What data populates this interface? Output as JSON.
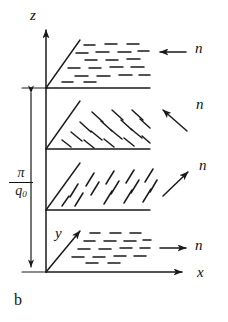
{
  "figure": {
    "panel_label": "b",
    "caption_letter": "b",
    "background_color": "#ffffff",
    "ink_color": "#1a1a1a"
  },
  "axes": {
    "z": {
      "label": "z",
      "x": 31,
      "y": 12
    },
    "x": {
      "label": "x",
      "x": 198,
      "y": 274
    },
    "y": {
      "label": "y",
      "x": 55,
      "y": 228
    }
  },
  "pitch_annotation": {
    "numerator": "π",
    "denominator": "q",
    "denominator_subscript": "0",
    "combined": "π/q₀",
    "arrow_style": "double-headed-vertical",
    "top_y": 88,
    "bottom_y": 272
  },
  "layers": [
    {
      "index": 1,
      "position": "top",
      "base_y": 88,
      "director_label": "n",
      "director_arrow_direction": "left",
      "director_arrow_angle_deg": 180,
      "dash_orientation": "horizontal",
      "dash_angle_deg": 0
    },
    {
      "index": 2,
      "position": "upper-middle",
      "base_y": 149,
      "director_label": "n",
      "director_arrow_direction": "up-left",
      "director_arrow_angle_deg": 145,
      "dash_orientation": "tilted-down-right",
      "dash_angle_deg": -40
    },
    {
      "index": 3,
      "position": "lower-middle",
      "base_y": 210,
      "director_label": "n",
      "director_arrow_direction": "up-right",
      "director_arrow_angle_deg": 38,
      "dash_orientation": "tilted-up-right",
      "dash_angle_deg": 55
    },
    {
      "index": 4,
      "position": "bottom",
      "base_y": 272,
      "director_label": "n",
      "director_arrow_direction": "right",
      "director_arrow_angle_deg": 0,
      "dash_orientation": "horizontal",
      "dash_angle_deg": 0
    }
  ],
  "director_labels": [
    {
      "text": "n",
      "x": 196,
      "y": 49
    },
    {
      "text": "n",
      "x": 196,
      "y": 105
    },
    {
      "text": "n",
      "x": 199,
      "y": 166
    },
    {
      "text": "n",
      "x": 196,
      "y": 245
    }
  ]
}
